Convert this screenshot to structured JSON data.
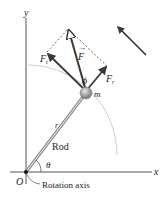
{
  "diagram": {
    "axes": {
      "x_label": "x",
      "y_label": "y",
      "origin_label": "O"
    },
    "labels": {
      "force": "F",
      "tangential_force": "F",
      "tangential_sub": "t",
      "radial_force": "F",
      "radial_sub": "r",
      "angle_phi": "ϕ",
      "mass": "m",
      "radius": "r",
      "rod": "Rod",
      "angle_theta": "θ",
      "rotation_axis": "Rotation axis"
    },
    "colors": {
      "axis": "#555555",
      "arrow": "#3a3a3a",
      "circle_arc": "#c8c8c8",
      "rod": "#888888",
      "mass": "#9a9a9a"
    }
  }
}
